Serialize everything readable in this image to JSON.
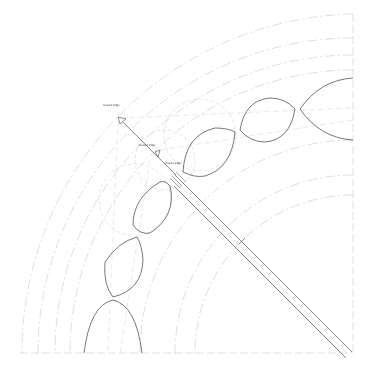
{
  "drawing": {
    "type": "technical-cad-drawing",
    "description": "Quarter-circle layout of lobed/elliptical chain with dashed construction arcs and a diagonal shaft",
    "background": "#ffffff",
    "line_color": "#444444",
    "construction_color": "#bbbbbb",
    "labels": [
      {
        "text": "Head 1 Edge",
        "x": 103,
        "y": 106
      },
      {
        "text": "Head 2 Edge",
        "x": 139,
        "y": 146
      },
      {
        "text": "Head 3 Edge",
        "x": 165,
        "y": 164
      }
    ]
  }
}
